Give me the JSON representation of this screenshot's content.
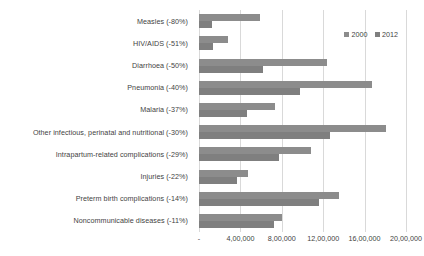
{
  "chart_data": {
    "type": "bar",
    "orientation": "horizontal",
    "title": "",
    "xlabel": "",
    "ylabel": "",
    "xlim": [
      0,
      2000000
    ],
    "grid": true,
    "legend_position": "top-right",
    "categories": [
      "Measles (-80%)",
      "HIV/AIDS (-51%)",
      "Diarrhoea (-50%)",
      "Pneumonia (-40%)",
      "Malaria (-37%)",
      "Other infectious, perinatal and nutritional (-30%)",
      "Intrapartum-related complications (-29%)",
      "Injuries (-22%)",
      "Preterm birth complications (-14%)",
      "Noncommunicable diseases (-11%)"
    ],
    "series": [
      {
        "name": "2000",
        "color": "#8c8c8c",
        "values": [
          590000,
          280000,
          1240000,
          1670000,
          730000,
          1810000,
          1080000,
          475000,
          1350000,
          800000
        ]
      },
      {
        "name": "2012",
        "color": "#7f7f7f",
        "values": [
          125000,
          140000,
          620000,
          980000,
          460000,
          1270000,
          770000,
          370000,
          1160000,
          720000
        ]
      }
    ],
    "tick_labels": [
      "-",
      "4,00,000",
      "8,00,000",
      "12,00,000",
      "16,00,000",
      "20,00,000"
    ],
    "tick_values": [
      0,
      400000,
      800000,
      1200000,
      1600000,
      2000000
    ]
  },
  "legend": {
    "items": [
      {
        "label": "2000",
        "color": "#8c8c8c"
      },
      {
        "label": "2012",
        "color": "#7f7f7f"
      }
    ]
  }
}
